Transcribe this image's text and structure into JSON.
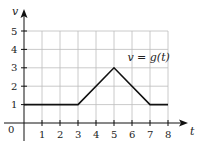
{
  "chart_data": {
    "type": "line",
    "title": "",
    "xlabel": "t",
    "ylabel": "v",
    "xlim": [
      0,
      8
    ],
    "ylim": [
      0,
      5
    ],
    "x_ticks": [
      "0",
      "1",
      "2",
      "3",
      "4",
      "5",
      "6",
      "7",
      "8"
    ],
    "y_ticks": [
      "1",
      "2",
      "3",
      "4",
      "5"
    ],
    "grid": true,
    "series": [
      {
        "name": "v = g(t)",
        "x": [
          0,
          3,
          5,
          7,
          8
        ],
        "y": [
          1,
          1,
          3,
          1,
          1
        ]
      }
    ],
    "annotations": [
      {
        "text": "v = g(t)",
        "x": 6.3,
        "y": 3.6
      }
    ],
    "colors": {
      "curve": "#111111",
      "grid": "#bdbdbd",
      "axis": "#111111"
    }
  }
}
